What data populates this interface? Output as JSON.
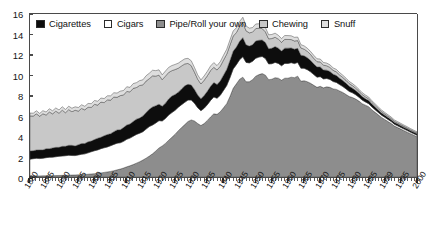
{
  "chart_data": {
    "type": "area",
    "title": "",
    "subtitle": "",
    "xlabel": "",
    "ylabel": "",
    "stacked": true,
    "grid": false,
    "legend_position": "top-inside",
    "xlim": [
      1880,
      2000
    ],
    "ylim": [
      0,
      16
    ],
    "yticks": [
      0,
      2,
      4,
      6,
      8,
      10,
      12,
      14,
      16
    ],
    "ytick_labels": [
      "0",
      "2",
      "4",
      "6",
      "8",
      "10",
      "12",
      "14",
      "16"
    ],
    "xticks": [
      1880,
      1885,
      1890,
      1895,
      1900,
      1905,
      1910,
      1915,
      1920,
      1925,
      1930,
      1935,
      1940,
      1945,
      1950,
      1955,
      1960,
      1965,
      1970,
      1975,
      1980,
      1985,
      1990,
      1995,
      2000
    ],
    "xtick_labels": [
      "1880",
      "1885",
      "1890",
      "1895",
      "1900",
      "1905",
      "1910",
      "1915",
      "1920",
      "1925",
      "1930",
      "1935",
      "1940",
      "1945",
      "1950",
      "1955",
      "1960",
      "1965",
      "1970",
      "1975",
      "1980",
      "1985",
      "1999",
      "1995",
      "2000"
    ],
    "x_minor_tick_interval": 1,
    "x": [
      1880,
      1881,
      1882,
      1883,
      1884,
      1885,
      1886,
      1887,
      1888,
      1889,
      1890,
      1891,
      1892,
      1893,
      1894,
      1895,
      1896,
      1897,
      1898,
      1899,
      1900,
      1901,
      1902,
      1903,
      1904,
      1905,
      1906,
      1907,
      1908,
      1909,
      1910,
      1911,
      1912,
      1913,
      1914,
      1915,
      1916,
      1917,
      1918,
      1919,
      1920,
      1921,
      1922,
      1923,
      1924,
      1925,
      1926,
      1927,
      1928,
      1929,
      1930,
      1931,
      1932,
      1933,
      1934,
      1935,
      1936,
      1937,
      1938,
      1939,
      1940,
      1941,
      1942,
      1943,
      1944,
      1945,
      1946,
      1947,
      1948,
      1949,
      1950,
      1951,
      1952,
      1953,
      1954,
      1955,
      1956,
      1957,
      1958,
      1959,
      1960,
      1961,
      1962,
      1963,
      1964,
      1965,
      1966,
      1967,
      1968,
      1969,
      1970,
      1971,
      1972,
      1973,
      1974,
      1975,
      1976,
      1977,
      1978,
      1979,
      1980,
      1981,
      1982,
      1983,
      1984,
      1985,
      1986,
      1987,
      1988,
      1989,
      1990,
      1991,
      1992,
      1993,
      1994,
      1995,
      1996,
      1997,
      1998,
      1999,
      2000
    ],
    "series": [
      {
        "name": "Pipe/Roll your own",
        "color": "#8d8d8d",
        "stack_order": 1,
        "values": [
          0.1,
          0.1,
          0.11,
          0.11,
          0.12,
          0.12,
          0.13,
          0.13,
          0.14,
          0.15,
          0.16,
          0.17,
          0.18,
          0.19,
          0.2,
          0.22,
          0.23,
          0.25,
          0.27,
          0.3,
          0.33,
          0.36,
          0.4,
          0.45,
          0.5,
          0.55,
          0.62,
          0.7,
          0.78,
          0.88,
          1.0,
          1.1,
          1.22,
          1.36,
          1.5,
          1.66,
          1.85,
          2.05,
          2.28,
          2.55,
          2.85,
          3.05,
          3.3,
          3.6,
          3.9,
          4.2,
          4.55,
          4.85,
          5.15,
          5.45,
          5.6,
          5.5,
          5.25,
          5.05,
          5.25,
          5.55,
          5.9,
          6.2,
          6.15,
          6.4,
          6.8,
          7.2,
          7.9,
          8.7,
          9.15,
          9.6,
          9.8,
          9.35,
          9.35,
          9.55,
          9.9,
          10.05,
          10.15,
          10.0,
          9.55,
          9.6,
          9.75,
          9.7,
          9.5,
          9.7,
          9.7,
          9.8,
          9.75,
          9.9,
          9.4,
          9.45,
          9.35,
          9.2,
          9.0,
          8.8,
          8.9,
          8.75,
          8.85,
          8.8,
          8.65,
          8.6,
          8.45,
          8.3,
          8.1,
          7.9,
          7.8,
          7.65,
          7.45,
          7.2,
          7.05,
          6.9,
          6.6,
          6.35,
          6.1,
          5.85,
          5.65,
          5.45,
          5.25,
          5.0,
          4.85,
          4.7,
          4.55,
          4.4,
          4.25,
          4.1,
          3.95
        ]
      },
      {
        "name": "Cigars",
        "color": "#ffffff",
        "stack_order": 2,
        "values": [
          1.65,
          1.7,
          1.72,
          1.7,
          1.72,
          1.78,
          1.8,
          1.82,
          1.85,
          1.88,
          1.9,
          1.92,
          1.95,
          1.92,
          1.9,
          1.95,
          2.0,
          2.02,
          2.1,
          2.18,
          2.25,
          2.3,
          2.38,
          2.42,
          2.45,
          2.52,
          2.58,
          2.62,
          2.58,
          2.62,
          2.7,
          2.72,
          2.78,
          2.82,
          2.8,
          2.78,
          2.85,
          2.9,
          2.82,
          2.75,
          2.68,
          2.45,
          2.45,
          2.48,
          2.42,
          2.35,
          2.3,
          2.25,
          2.18,
          2.1,
          1.95,
          1.75,
          1.55,
          1.45,
          1.5,
          1.55,
          1.62,
          1.65,
          1.58,
          1.62,
          1.7,
          1.78,
          1.85,
          1.9,
          1.88,
          1.92,
          2.0,
          1.9,
          1.85,
          1.8,
          1.75,
          1.72,
          1.68,
          1.62,
          1.55,
          1.52,
          1.5,
          1.45,
          1.42,
          1.45,
          1.45,
          1.42,
          1.38,
          1.35,
          1.28,
          1.22,
          1.18,
          1.12,
          1.05,
          1.0,
          0.95,
          0.88,
          0.82,
          0.78,
          0.72,
          0.68,
          0.62,
          0.58,
          0.55,
          0.5,
          0.46,
          0.42,
          0.38,
          0.35,
          0.32,
          0.3,
          0.28,
          0.26,
          0.24,
          0.22,
          0.21,
          0.2,
          0.19,
          0.18,
          0.17,
          0.17,
          0.16,
          0.16,
          0.15,
          0.15,
          0.15
        ]
      },
      {
        "name": "Cigarettes",
        "color": "#0d0d0d",
        "stack_order": 3,
        "values": [
          0.8,
          0.78,
          0.82,
          0.85,
          0.82,
          0.88,
          0.85,
          0.9,
          0.92,
          0.88,
          0.95,
          0.92,
          0.98,
          1.0,
          0.95,
          1.0,
          1.05,
          1.02,
          1.08,
          1.05,
          1.1,
          1.15,
          1.12,
          1.18,
          1.22,
          1.18,
          1.25,
          1.3,
          1.28,
          1.35,
          1.4,
          1.38,
          1.45,
          1.5,
          1.48,
          1.55,
          1.62,
          1.7,
          1.78,
          1.7,
          1.62,
          1.45,
          1.5,
          1.58,
          1.62,
          1.55,
          1.48,
          1.55,
          1.62,
          1.55,
          1.48,
          1.35,
          1.25,
          1.18,
          1.25,
          1.32,
          1.38,
          1.42,
          1.35,
          1.4,
          1.5,
          1.58,
          1.68,
          1.75,
          1.72,
          1.8,
          1.88,
          1.72,
          1.65,
          1.62,
          1.7,
          1.65,
          1.62,
          1.58,
          1.48,
          1.52,
          1.55,
          1.5,
          1.45,
          1.5,
          1.5,
          1.45,
          1.42,
          1.38,
          1.28,
          1.22,
          1.18,
          1.12,
          1.05,
          1.0,
          0.95,
          0.88,
          0.82,
          0.78,
          0.72,
          0.68,
          0.62,
          0.58,
          0.55,
          0.5,
          0.46,
          0.42,
          0.38,
          0.35,
          0.32,
          0.3,
          0.28,
          0.26,
          0.24,
          0.22,
          0.21,
          0.2,
          0.19,
          0.18,
          0.17,
          0.17,
          0.16,
          0.16,
          0.15,
          0.15,
          0.15
        ]
      },
      {
        "name": "Chewing",
        "color": "#c8c8c8",
        "stack_order": 4,
        "values": [
          3.45,
          3.4,
          3.55,
          3.3,
          3.55,
          3.3,
          3.6,
          3.35,
          3.55,
          3.35,
          3.55,
          3.3,
          3.5,
          3.3,
          3.5,
          3.3,
          3.45,
          3.3,
          3.4,
          3.3,
          3.45,
          3.25,
          3.45,
          3.25,
          3.4,
          3.3,
          3.4,
          3.2,
          3.35,
          3.2,
          3.3,
          3.15,
          3.25,
          3.1,
          3.2,
          3.05,
          3.1,
          3.0,
          3.05,
          2.9,
          2.85,
          2.6,
          2.65,
          2.6,
          2.5,
          2.45,
          2.35,
          2.25,
          2.15,
          2.05,
          1.9,
          1.7,
          1.55,
          1.45,
          1.5,
          1.52,
          1.55,
          1.5,
          1.42,
          1.45,
          1.48,
          1.5,
          1.52,
          1.48,
          1.42,
          1.45,
          1.48,
          1.38,
          1.3,
          1.25,
          1.22,
          1.18,
          1.12,
          1.05,
          0.98,
          0.95,
          0.92,
          0.88,
          0.85,
          0.86,
          0.85,
          0.82,
          0.8,
          0.76,
          0.7,
          0.66,
          0.62,
          0.58,
          0.55,
          0.52,
          0.5,
          0.46,
          0.43,
          0.4,
          0.38,
          0.36,
          0.33,
          0.31,
          0.29,
          0.27,
          0.25,
          0.23,
          0.22,
          0.2,
          0.19,
          0.18,
          0.17,
          0.16,
          0.15,
          0.14,
          0.13,
          0.12,
          0.12,
          0.11,
          0.11,
          0.1,
          0.1,
          0.09,
          0.09,
          0.08,
          0.08
        ]
      },
      {
        "name": "Snuff",
        "color": "#dedede",
        "stack_order": 5,
        "values": [
          0.28,
          0.28,
          0.3,
          0.28,
          0.3,
          0.3,
          0.32,
          0.3,
          0.32,
          0.32,
          0.34,
          0.32,
          0.34,
          0.34,
          0.34,
          0.35,
          0.36,
          0.35,
          0.37,
          0.37,
          0.38,
          0.38,
          0.4,
          0.4,
          0.4,
          0.42,
          0.42,
          0.42,
          0.44,
          0.44,
          0.46,
          0.45,
          0.47,
          0.48,
          0.48,
          0.5,
          0.52,
          0.54,
          0.55,
          0.54,
          0.52,
          0.48,
          0.5,
          0.5,
          0.5,
          0.5,
          0.5,
          0.5,
          0.5,
          0.5,
          0.48,
          0.45,
          0.42,
          0.4,
          0.42,
          0.44,
          0.45,
          0.46,
          0.44,
          0.45,
          0.47,
          0.48,
          0.5,
          0.5,
          0.48,
          0.5,
          0.52,
          0.48,
          0.46,
          0.45,
          0.45,
          0.44,
          0.43,
          0.42,
          0.4,
          0.4,
          0.4,
          0.38,
          0.37,
          0.38,
          0.38,
          0.37,
          0.36,
          0.35,
          0.33,
          0.32,
          0.31,
          0.3,
          0.29,
          0.28,
          0.28,
          0.27,
          0.26,
          0.25,
          0.24,
          0.24,
          0.23,
          0.22,
          0.21,
          0.2,
          0.2,
          0.19,
          0.18,
          0.18,
          0.17,
          0.17,
          0.16,
          0.16,
          0.15,
          0.15,
          0.14,
          0.14,
          0.13,
          0.13,
          0.13,
          0.12,
          0.12,
          0.12,
          0.11,
          0.11,
          0.11
        ]
      }
    ],
    "legend": [
      {
        "label": "Cigarettes",
        "color": "#0d0d0d"
      },
      {
        "label": "Cigars",
        "color": "#ffffff"
      },
      {
        "label": "Pipe/Roll your own",
        "color": "#8d8d8d"
      },
      {
        "label": "Chewing",
        "color": "#c8c8c8"
      },
      {
        "label": "Snuff",
        "color": "#dedede"
      }
    ],
    "notes": {
      "peak_year": 1952,
      "peak_total": 13.9,
      "start_total": 6.3,
      "end_total": 4.4
    }
  }
}
